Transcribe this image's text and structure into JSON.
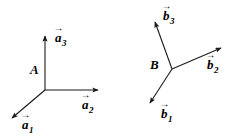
{
  "figure": {
    "background_color": "#ffffff",
    "stroke_color": "#1a1a1a",
    "width": 243,
    "height": 138
  },
  "triads": [
    {
      "id": "triad-a",
      "origin_label": "A",
      "origin_label_x": 30,
      "origin_label_y": 63,
      "origin_x": 45,
      "origin_y": 90,
      "vectors": [
        {
          "name": "a1",
          "symbol": "a",
          "subscript": "1",
          "accent": "→",
          "tip_x": 9,
          "tip_y": 121,
          "label_x": 22,
          "label_y": 118
        },
        {
          "name": "a2",
          "symbol": "a",
          "subscript": "2",
          "accent": "→",
          "tip_x": 103,
          "tip_y": 90,
          "label_x": 82,
          "label_y": 98
        },
        {
          "name": "a3",
          "symbol": "a",
          "subscript": "3",
          "accent": "→",
          "tip_x": 45,
          "tip_y": 31,
          "label_x": 55,
          "label_y": 31
        }
      ]
    },
    {
      "id": "triad-b",
      "origin_label": "B",
      "origin_label_x": 150,
      "origin_label_y": 58,
      "origin_x": 172,
      "origin_y": 69,
      "vectors": [
        {
          "name": "b1",
          "symbol": "b",
          "subscript": "1",
          "accent": "→",
          "tip_x": 147,
          "tip_y": 107,
          "label_x": 161,
          "label_y": 107
        },
        {
          "name": "b2",
          "symbol": "b",
          "subscript": "2",
          "accent": "→",
          "tip_x": 226,
          "tip_y": 45,
          "label_x": 207,
          "label_y": 58
        },
        {
          "name": "b3",
          "symbol": "b",
          "subscript": "3",
          "accent": "→",
          "tip_x": 152,
          "tip_y": 17,
          "label_x": 163,
          "label_y": 9
        }
      ]
    }
  ]
}
